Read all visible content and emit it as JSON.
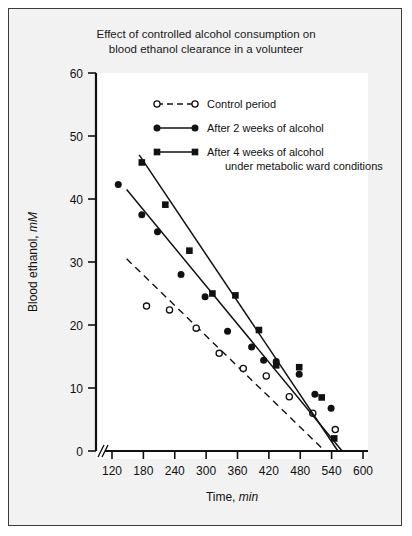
{
  "figure": {
    "title_line1": "Effect of controlled alcohol consumption on",
    "title_line2": "blood ethanol clearance in a volunteer",
    "background_color": "#f2f2f2",
    "plot_background_color": "#ffffff",
    "border_color": "#3c3c3c",
    "axis_color": "#111111"
  },
  "legend": {
    "items": [
      {
        "label": "Control period",
        "marker": "open-circle",
        "line": "dashed"
      },
      {
        "label": "After 2 weeks of alcohol",
        "marker": "filled-circle",
        "line": "solid"
      },
      {
        "label": "After 4 weeks of alcohol",
        "label2": "under metabolic ward conditions",
        "marker": "filled-square",
        "line": "solid"
      }
    ]
  },
  "chart_data": {
    "type": "scatter",
    "title": "Effect of controlled alcohol consumption on blood ethanol clearance in a volunteer",
    "xlabel": "Time, min",
    "ylabel": "Blood ethanol, mM",
    "xlim": [
      100,
      600
    ],
    "ylim": [
      0,
      60
    ],
    "xticks": [
      120,
      180,
      240,
      300,
      360,
      420,
      480,
      540,
      600
    ],
    "yticks": [
      0,
      10,
      20,
      30,
      40,
      50,
      60
    ],
    "axis_break_x": true,
    "grid": false,
    "legend_position": "top-center",
    "series": [
      {
        "name": "Control period",
        "marker": "open-circle",
        "line": "dashed",
        "x": [
          186,
          230,
          281,
          325,
          371,
          415,
          459,
          504,
          547
        ],
        "y": [
          23.0,
          22.4,
          19.5,
          15.5,
          13.1,
          11.9,
          8.6,
          6.0,
          3.4
        ],
        "fit_x": [
          148,
          527
        ],
        "fit_y": [
          30.5,
          0.0
        ]
      },
      {
        "name": "After 2 weeks of alcohol",
        "marker": "filled-circle",
        "line": "solid",
        "x": [
          132,
          177,
          207,
          252,
          298,
          341,
          387,
          410,
          434,
          478,
          508,
          539
        ],
        "y": [
          42.3,
          37.5,
          34.8,
          28.0,
          24.5,
          19.0,
          16.5,
          14.4,
          14.2,
          12.2,
          9.0,
          6.8
        ],
        "fit_x": [
          148,
          560
        ],
        "fit_y": [
          41.5,
          0.0
        ]
      },
      {
        "name": "After 4 weeks of alcohol under metabolic ward conditions",
        "marker": "filled-square",
        "line": "solid",
        "x": [
          177,
          222,
          268,
          312,
          356,
          401,
          434,
          478,
          521,
          545
        ],
        "y": [
          45.8,
          39.1,
          31.8,
          25.0,
          24.7,
          19.2,
          13.6,
          13.3,
          8.5,
          2.0
        ],
        "fit_x": [
          172,
          552
        ],
        "fit_y": [
          47.0,
          0.0
        ]
      }
    ]
  },
  "axes": {
    "ylabel_text": "Blood ethanol, ",
    "ylabel_italic": "mM",
    "xlabel_text": "Time, ",
    "xlabel_italic": "min"
  }
}
